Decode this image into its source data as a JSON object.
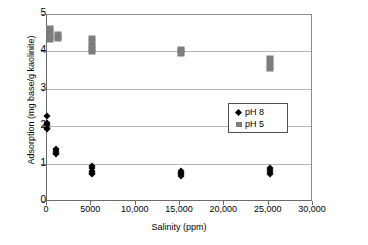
{
  "chart_data": {
    "type": "scatter",
    "title": "",
    "xlabel": "Salinity (ppm)",
    "ylabel": "Adsorption (mg base/g kaolinite)",
    "xlim": [
      0,
      30000
    ],
    "ylim": [
      0,
      5
    ],
    "grid": "horizontal",
    "legend_position": "middle-right",
    "xticks": [
      {
        "value": 0,
        "label": "0"
      },
      {
        "value": 5000,
        "label": "5000"
      },
      {
        "value": 10000,
        "label": "10,000"
      },
      {
        "value": 15000,
        "label": "15,000"
      },
      {
        "value": 20000,
        "label": "20,000"
      },
      {
        "value": 25000,
        "label": "25,000"
      },
      {
        "value": 30000,
        "label": "30,000"
      }
    ],
    "yticks": [
      {
        "value": 0,
        "label": "0"
      },
      {
        "value": 1,
        "label": "1"
      },
      {
        "value": 2,
        "label": "2"
      },
      {
        "value": 3,
        "label": "3"
      },
      {
        "value": 4,
        "label": "4"
      },
      {
        "value": 5,
        "label": "5"
      }
    ],
    "series": [
      {
        "name": "pH 8",
        "marker": "diamond",
        "color": "#000000",
        "points": [
          {
            "x": 0,
            "y": 2.3
          },
          {
            "x": 0,
            "y": 2.1
          },
          {
            "x": 0,
            "y": 2.05
          },
          {
            "x": 0,
            "y": 1.98
          },
          {
            "x": 0,
            "y": 1.94
          },
          {
            "x": 1000,
            "y": 1.42
          },
          {
            "x": 1000,
            "y": 1.36
          },
          {
            "x": 1000,
            "y": 1.31
          },
          {
            "x": 1000,
            "y": 1.28
          },
          {
            "x": 5100,
            "y": 0.96
          },
          {
            "x": 5100,
            "y": 0.9
          },
          {
            "x": 5100,
            "y": 0.84
          },
          {
            "x": 5100,
            "y": 0.78
          },
          {
            "x": 5100,
            "y": 0.74
          },
          {
            "x": 15100,
            "y": 0.82
          },
          {
            "x": 15100,
            "y": 0.78
          },
          {
            "x": 15100,
            "y": 0.74
          },
          {
            "x": 15100,
            "y": 0.7
          },
          {
            "x": 25200,
            "y": 0.9
          },
          {
            "x": 25200,
            "y": 0.85
          },
          {
            "x": 25200,
            "y": 0.8
          },
          {
            "x": 25200,
            "y": 0.76
          }
        ]
      },
      {
        "name": "pH 5",
        "marker": "square",
        "color": "#7d7d7d",
        "points": [
          {
            "x": 300,
            "y": 4.66
          },
          {
            "x": 300,
            "y": 4.58
          },
          {
            "x": 300,
            "y": 4.5
          },
          {
            "x": 300,
            "y": 4.42
          },
          {
            "x": 300,
            "y": 4.34
          },
          {
            "x": 1200,
            "y": 4.48
          },
          {
            "x": 1200,
            "y": 4.42
          },
          {
            "x": 1200,
            "y": 4.36
          },
          {
            "x": 5100,
            "y": 4.38
          },
          {
            "x": 5100,
            "y": 4.28
          },
          {
            "x": 5100,
            "y": 4.18
          },
          {
            "x": 5100,
            "y": 4.08
          },
          {
            "x": 5100,
            "y": 4.0
          },
          {
            "x": 15100,
            "y": 4.1
          },
          {
            "x": 15100,
            "y": 4.03
          },
          {
            "x": 15100,
            "y": 3.97
          },
          {
            "x": 25200,
            "y": 3.84
          },
          {
            "x": 25200,
            "y": 3.74
          },
          {
            "x": 25200,
            "y": 3.64
          },
          {
            "x": 25200,
            "y": 3.55
          }
        ]
      }
    ]
  },
  "legend": {
    "items": [
      {
        "label": "pH 8",
        "marker": "diamond"
      },
      {
        "label": "pH 5",
        "marker": "square"
      }
    ]
  }
}
